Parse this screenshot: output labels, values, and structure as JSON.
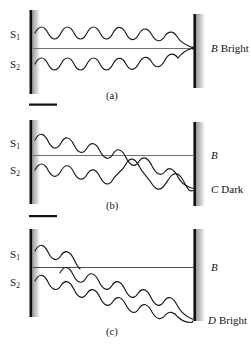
{
  "figure": {
    "width": 251,
    "height": 347,
    "colors": {
      "background": "#ffffff",
      "wave_stroke": "#1a1a1a",
      "axis_line": "#6e6e6e",
      "barrier": "#111111",
      "barrier_shadow": "#b8b8b8",
      "text": "#111111"
    }
  },
  "panels": [
    {
      "id": "a",
      "caption": "(a)",
      "source_labels": [
        {
          "name": "S1",
          "text": "S",
          "sub": "1"
        },
        {
          "name": "S2",
          "text": "S",
          "sub": "2"
        }
      ],
      "result_label": {
        "point": "B",
        "kind": "Bright"
      },
      "description": "Waves from S1 and S2 arrive in phase at B, reinforcing to give a bright fringe."
    },
    {
      "id": "b",
      "caption": "(b)",
      "source_labels": [
        {
          "name": "S1",
          "text": "S",
          "sub": "1"
        },
        {
          "name": "S2",
          "text": "S",
          "sub": "2"
        }
      ],
      "axis_label": {
        "point": "B",
        "kind": ""
      },
      "result_label": {
        "point": "C",
        "kind": "Dark"
      },
      "description": "Waves arrive at C one half wavelength out of step, cancelling to give a dark fringe."
    },
    {
      "id": "c",
      "caption": "(c)",
      "source_labels": [
        {
          "name": "S1",
          "text": "S",
          "sub": "1"
        },
        {
          "name": "S2",
          "text": "S",
          "sub": "2"
        }
      ],
      "axis_label": {
        "point": "B",
        "kind": ""
      },
      "result_label": {
        "point": "D",
        "kind": "Bright"
      },
      "description": "Waves arrive at D one full wavelength out of step, reinforcing to give a bright fringe."
    }
  ]
}
